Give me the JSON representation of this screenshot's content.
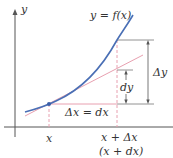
{
  "diagram": {
    "labels": {
      "y_axis": "y",
      "curve": "y = f(x)",
      "delta_x": "Δx = dx",
      "dy": "dy",
      "delta_y": "Δy",
      "x_tick": "x",
      "x_plus_delta_x": "x + Δx",
      "x_plus_dx": "(x + dx)"
    },
    "colors": {
      "curve": "#4a6fb5",
      "tangent": "#e8a0b0",
      "dashed_guides": "#e8a0b0",
      "axes": "#555555",
      "measure_lines": "#777777",
      "text": "#333333",
      "point": "#3a5fa8"
    }
  }
}
